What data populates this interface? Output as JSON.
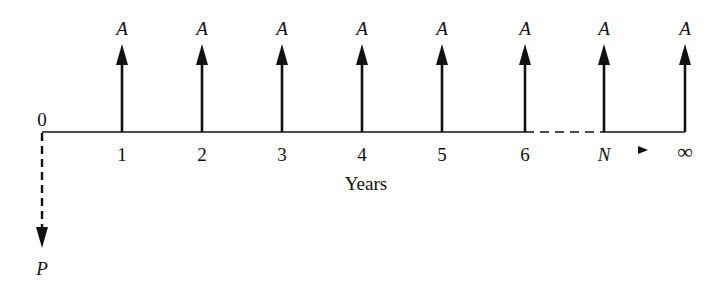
{
  "diagram": {
    "type": "cash-flow-diagram",
    "axis_label": "Years",
    "origin_label": "0",
    "present_value_label": "P",
    "payment_label": "A",
    "continuation_arrow": "►",
    "periods": [
      {
        "label": "1",
        "x": 122,
        "payment": "A"
      },
      {
        "label": "2",
        "x": 202,
        "payment": "A"
      },
      {
        "label": "3",
        "x": 282,
        "payment": "A"
      },
      {
        "label": "4",
        "x": 362,
        "payment": "A"
      },
      {
        "label": "5",
        "x": 442,
        "payment": "A"
      },
      {
        "label": "6",
        "x": 525,
        "payment": "A"
      },
      {
        "label": "N",
        "x": 604,
        "payment": "A"
      },
      {
        "label": "∞",
        "x": 685,
        "payment": "A"
      }
    ],
    "colors": {
      "line": "#111111",
      "background": "#ffffff"
    }
  }
}
